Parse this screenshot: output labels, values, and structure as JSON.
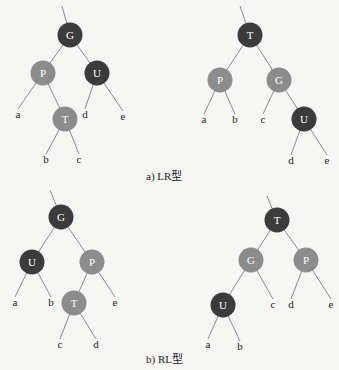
{
  "colors": {
    "background": "#f6f6f4",
    "dark_node": "#3b3b3b",
    "light_node": "#8c8c8c",
    "edge": "#8a8a8a",
    "node_text": "#ffffff",
    "leaf_text": "#222222"
  },
  "node_radius": 12.5,
  "figures": [
    {
      "id": "lr-before",
      "root_edge": {
        "x1": 62,
        "y1": 6,
        "x2": 70,
        "y2": 35
      },
      "nodes": [
        {
          "label": "G",
          "x": 70,
          "y": 35,
          "shade": "dark"
        },
        {
          "label": "P",
          "x": 43,
          "y": 73,
          "shade": "light"
        },
        {
          "label": "U",
          "x": 97,
          "y": 73,
          "shade": "dark"
        },
        {
          "label": "T",
          "x": 65,
          "y": 119,
          "shade": "light"
        }
      ],
      "leaves": [
        {
          "label": "a",
          "x": 18,
          "y": 118
        },
        {
          "label": "d",
          "x": 85,
          "y": 118
        },
        {
          "label": "e",
          "x": 123,
          "y": 120
        },
        {
          "label": "b",
          "x": 46,
          "y": 163
        },
        {
          "label": "c",
          "x": 79,
          "y": 163
        }
      ],
      "edges": [
        [
          "G",
          "P"
        ],
        [
          "G",
          "U"
        ],
        [
          "P",
          "a"
        ],
        [
          "P",
          "T"
        ],
        [
          "U",
          "d"
        ],
        [
          "U",
          "e"
        ],
        [
          "T",
          "b"
        ],
        [
          "T",
          "c"
        ]
      ]
    },
    {
      "id": "lr-after",
      "root_edge": {
        "x1": 240,
        "y1": 6,
        "x2": 250,
        "y2": 35
      },
      "nodes": [
        {
          "label": "T",
          "x": 250,
          "y": 35,
          "shade": "dark"
        },
        {
          "label": "P",
          "x": 220,
          "y": 80,
          "shade": "light"
        },
        {
          "label": "G",
          "x": 279,
          "y": 80,
          "shade": "light"
        },
        {
          "label": "U",
          "x": 304,
          "y": 119,
          "shade": "dark"
        }
      ],
      "leaves": [
        {
          "label": "a",
          "x": 204,
          "y": 123
        },
        {
          "label": "b",
          "x": 235,
          "y": 123
        },
        {
          "label": "c",
          "x": 263,
          "y": 123
        },
        {
          "label": "d",
          "x": 291,
          "y": 164
        },
        {
          "label": "e",
          "x": 327,
          "y": 164
        }
      ],
      "edges": [
        [
          "T",
          "P"
        ],
        [
          "T",
          "G"
        ],
        [
          "P",
          "a"
        ],
        [
          "P",
          "b"
        ],
        [
          "G",
          "c"
        ],
        [
          "G",
          "U"
        ],
        [
          "U",
          "d"
        ],
        [
          "U",
          "e"
        ]
      ]
    },
    {
      "id": "rl-before",
      "root_edge": {
        "x1": 50,
        "y1": 190,
        "x2": 61,
        "y2": 217
      },
      "nodes": [
        {
          "label": "G",
          "x": 61,
          "y": 217,
          "shade": "dark"
        },
        {
          "label": "U",
          "x": 32,
          "y": 262,
          "shade": "dark"
        },
        {
          "label": "P",
          "x": 92,
          "y": 262,
          "shade": "light"
        },
        {
          "label": "T",
          "x": 74,
          "y": 303,
          "shade": "light"
        }
      ],
      "leaves": [
        {
          "label": "a",
          "x": 15,
          "y": 306
        },
        {
          "label": "b",
          "x": 51,
          "y": 306
        },
        {
          "label": "e",
          "x": 115,
          "y": 306
        },
        {
          "label": "c",
          "x": 60,
          "y": 348
        },
        {
          "label": "d",
          "x": 96,
          "y": 348
        }
      ],
      "edges": [
        [
          "G",
          "U"
        ],
        [
          "G",
          "P"
        ],
        [
          "U",
          "a"
        ],
        [
          "U",
          "b"
        ],
        [
          "P",
          "T"
        ],
        [
          "P",
          "e"
        ],
        [
          "T",
          "c"
        ],
        [
          "T",
          "d"
        ]
      ]
    },
    {
      "id": "rl-after",
      "root_edge": {
        "x1": 267,
        "y1": 196,
        "x2": 277,
        "y2": 220
      },
      "nodes": [
        {
          "label": "T",
          "x": 277,
          "y": 220,
          "shade": "dark"
        },
        {
          "label": "G",
          "x": 251,
          "y": 260,
          "shade": "light"
        },
        {
          "label": "P",
          "x": 306,
          "y": 260,
          "shade": "light"
        },
        {
          "label": "U",
          "x": 223,
          "y": 305,
          "shade": "dark"
        }
      ],
      "leaves": [
        {
          "label": "c",
          "x": 273,
          "y": 308
        },
        {
          "label": "d",
          "x": 291,
          "y": 308
        },
        {
          "label": "e",
          "x": 331,
          "y": 308
        },
        {
          "label": "a",
          "x": 208,
          "y": 348
        },
        {
          "label": "b",
          "x": 240,
          "y": 350
        }
      ],
      "edges": [
        [
          "T",
          "G"
        ],
        [
          "T",
          "P"
        ],
        [
          "G",
          "U"
        ],
        [
          "G",
          "c"
        ],
        [
          "P",
          "d"
        ],
        [
          "P",
          "e"
        ],
        [
          "U",
          "a"
        ],
        [
          "U",
          "b"
        ]
      ]
    }
  ],
  "captions": {
    "lr": "a) LR型",
    "rl": "b) RL型"
  }
}
